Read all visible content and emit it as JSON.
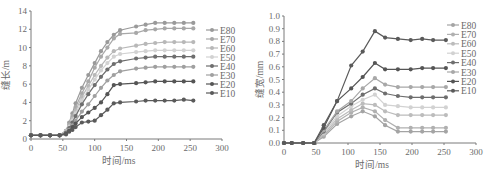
{
  "chart_data": [
    {
      "type": "line",
      "title": "",
      "xlabel": "时间/ms",
      "ylabel": "缝长/m",
      "xlim": [
        0,
        300
      ],
      "ylim": [
        0,
        14
      ],
      "xticks": [
        0,
        50,
        100,
        150,
        200,
        250,
        300
      ],
      "yticks": [
        0,
        2,
        4,
        6,
        8,
        10,
        12,
        14
      ],
      "grid": false,
      "legend_position": "right",
      "x": [
        0,
        15,
        30,
        45,
        55,
        60,
        65,
        70,
        80,
        90,
        100,
        110,
        120,
        130,
        140,
        165,
        180,
        195,
        210,
        225,
        240,
        255
      ],
      "series": [
        {
          "name": "E80",
          "color": "#9a9a9a",
          "values": [
            0.4,
            0.4,
            0.4,
            0.4,
            0.9,
            1.8,
            2.8,
            3.9,
            5.6,
            7.0,
            8.3,
            9.6,
            10.6,
            11.4,
            11.9,
            12.3,
            12.5,
            12.7,
            12.7,
            12.7,
            12.7,
            12.7
          ]
        },
        {
          "name": "E70",
          "color": "#a8a8a8",
          "values": [
            0.4,
            0.4,
            0.4,
            0.4,
            0.9,
            1.6,
            2.5,
            3.5,
            5.0,
            6.3,
            7.8,
            9.0,
            10.0,
            11.0,
            11.5,
            11.6,
            11.9,
            12.0,
            12.1,
            12.1,
            12.1,
            12.1
          ]
        },
        {
          "name": "E60",
          "color": "#b8b8b8",
          "values": [
            0.4,
            0.4,
            0.4,
            0.4,
            0.8,
            1.4,
            2.2,
            3.1,
            4.6,
            5.8,
            7.0,
            8.0,
            8.9,
            9.6,
            9.9,
            10.2,
            10.4,
            10.5,
            10.6,
            10.6,
            10.6,
            10.6
          ]
        },
        {
          "name": "E50",
          "color": "#d2d2d2",
          "values": [
            0.4,
            0.4,
            0.4,
            0.4,
            0.8,
            1.3,
            2.0,
            2.8,
            4.2,
            5.4,
            6.5,
            7.5,
            8.3,
            9.0,
            9.3,
            9.5,
            9.6,
            9.7,
            9.7,
            9.7,
            9.7,
            9.7
          ]
        },
        {
          "name": "E40",
          "color": "#6e6e6e",
          "values": [
            0.4,
            0.4,
            0.4,
            0.4,
            0.7,
            1.2,
            1.8,
            2.5,
            3.8,
            4.9,
            5.9,
            6.8,
            7.6,
            8.2,
            8.5,
            8.8,
            8.9,
            9.0,
            9.0,
            9.0,
            9.0,
            9.0
          ]
        },
        {
          "name": "E30",
          "color": "#a0a0a0",
          "values": [
            0.4,
            0.4,
            0.4,
            0.4,
            0.6,
            1.0,
            1.5,
            2.0,
            3.0,
            3.8,
            4.7,
            5.6,
            6.4,
            7.0,
            7.4,
            7.7,
            7.8,
            7.9,
            7.9,
            7.9,
            7.9,
            7.9
          ]
        },
        {
          "name": "E20",
          "color": "#555555",
          "values": [
            0.4,
            0.4,
            0.4,
            0.4,
            0.6,
            0.9,
            1.3,
            1.7,
            2.4,
            2.9,
            3.4,
            4.0,
            4.9,
            5.9,
            6.0,
            6.1,
            6.2,
            6.3,
            6.3,
            6.3,
            6.3,
            6.3
          ]
        },
        {
          "name": "E10",
          "color": "#5a5a5a",
          "values": [
            0.4,
            0.4,
            0.4,
            0.4,
            0.5,
            0.8,
            1.0,
            1.3,
            1.8,
            1.9,
            2.0,
            2.6,
            3.2,
            3.9,
            4.0,
            4.1,
            4.2,
            4.2,
            4.2,
            4.2,
            4.3,
            4.2
          ]
        }
      ]
    },
    {
      "type": "line",
      "title": "",
      "xlabel": "时间/ms",
      "ylabel": "缝宽/mm",
      "xlim": [
        0,
        300
      ],
      "ylim": [
        0,
        1.0
      ],
      "xticks": [
        0,
        50,
        100,
        150,
        200,
        250,
        300
      ],
      "yticks": [
        "0.0",
        "0.1",
        "0.2",
        "0.3",
        "0.4",
        "0.5",
        "0.6",
        "0.7",
        "0.8",
        "0.9",
        "1.0"
      ],
      "grid": false,
      "legend_position": "right",
      "x": [
        0,
        12,
        30,
        47,
        62,
        83,
        105,
        123,
        142,
        158,
        178,
        198,
        216,
        233,
        253
      ],
      "series": [
        {
          "name": "E80",
          "color": "#a4a4a4",
          "values": [
            0,
            0,
            0,
            0,
            0.05,
            0.15,
            0.21,
            0.25,
            0.21,
            0.14,
            0.09,
            0.09,
            0.09,
            0.09,
            0.09
          ]
        },
        {
          "name": "E70",
          "color": "#b0b0b0",
          "values": [
            0,
            0,
            0,
            0,
            0.06,
            0.17,
            0.24,
            0.28,
            0.25,
            0.18,
            0.12,
            0.12,
            0.12,
            0.12,
            0.12
          ]
        },
        {
          "name": "E60",
          "color": "#bcbcbc",
          "values": [
            0,
            0,
            0,
            0,
            0.07,
            0.19,
            0.26,
            0.31,
            0.3,
            0.25,
            0.22,
            0.22,
            0.22,
            0.22,
            0.22
          ]
        },
        {
          "name": "E50",
          "color": "#d2d2d2",
          "values": [
            0,
            0,
            0,
            0,
            0.08,
            0.21,
            0.29,
            0.34,
            0.38,
            0.3,
            0.29,
            0.28,
            0.28,
            0.28,
            0.28
          ]
        },
        {
          "name": "E40",
          "color": "#6e6e6e",
          "values": [
            0,
            0,
            0,
            0,
            0.09,
            0.24,
            0.31,
            0.38,
            0.43,
            0.39,
            0.37,
            0.36,
            0.36,
            0.36,
            0.36
          ]
        },
        {
          "name": "E30",
          "color": "#a8a8a8",
          "values": [
            0,
            0,
            0,
            0,
            0.1,
            0.25,
            0.33,
            0.43,
            0.51,
            0.46,
            0.44,
            0.44,
            0.44,
            0.44,
            0.44
          ]
        },
        {
          "name": "E20",
          "color": "#555555",
          "values": [
            0,
            0,
            0,
            0,
            0.12,
            0.33,
            0.43,
            0.52,
            0.63,
            0.58,
            0.58,
            0.58,
            0.59,
            0.59,
            0.59
          ]
        },
        {
          "name": "E10",
          "color": "#5a5a5a",
          "values": [
            0,
            0,
            0,
            0,
            0.14,
            0.33,
            0.61,
            0.72,
            0.88,
            0.83,
            0.82,
            0.81,
            0.82,
            0.81,
            0.81
          ]
        }
      ]
    }
  ],
  "charts": {
    "left": {
      "xlabel": "时间/ms",
      "ylabel": "缝长/m"
    },
    "right": {
      "xlabel": "时间/ms",
      "ylabel": "缝宽/mm"
    }
  }
}
